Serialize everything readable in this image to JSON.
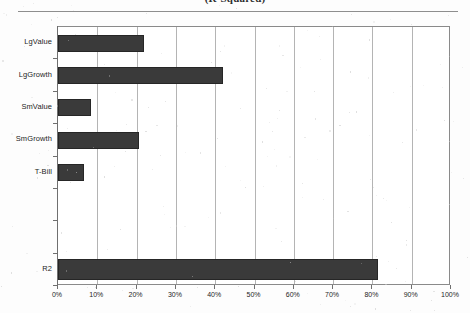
{
  "title": {
    "text": "(R-Squared)",
    "visible_note": "cropped at top edge"
  },
  "chart_data": {
    "type": "bar",
    "orientation": "horizontal",
    "title": "(R-Squared)",
    "xlabel": "",
    "ylabel": "",
    "categories": [
      "LgValue",
      "LgGrowth",
      "SmValue",
      "SmGrowth",
      "T-Bill",
      "",
      "",
      "R2"
    ],
    "values": [
      22,
      42,
      8.5,
      20.5,
      6.5,
      null,
      null,
      81.5
    ],
    "xlim": [
      0,
      100
    ],
    "xticks": [
      0,
      10,
      20,
      30,
      40,
      50,
      60,
      70,
      80,
      90,
      100
    ],
    "xticklabels": [
      "0%",
      "10%",
      "20%",
      "30%",
      "40%",
      "50%",
      "60%",
      "70%",
      "80%",
      "90%",
      "100%"
    ],
    "grid": true,
    "grid_axis": "x",
    "legend": false,
    "bar_color": "#3a3a3a"
  },
  "axis": {
    "x": {
      "ticks": [
        {
          "value": 0,
          "label": "0%"
        },
        {
          "value": 10,
          "label": "10%"
        },
        {
          "value": 20,
          "label": "20%"
        },
        {
          "value": 30,
          "label": "30%"
        },
        {
          "value": 40,
          "label": "40%"
        },
        {
          "value": 50,
          "label": "50%"
        },
        {
          "value": 60,
          "label": "60%"
        },
        {
          "value": 70,
          "label": "70%"
        },
        {
          "value": 80,
          "label": "80%"
        },
        {
          "value": 90,
          "label": "90%"
        },
        {
          "value": 100,
          "label": "100%"
        }
      ]
    },
    "y": {
      "categories": [
        {
          "label": "LgValue",
          "value": 22
        },
        {
          "label": "LgGrowth",
          "value": 42
        },
        {
          "label": "SmValue",
          "value": 8.5
        },
        {
          "label": "SmGrowth",
          "value": 20.5
        },
        {
          "label": "T-Bill",
          "value": 6.5
        },
        {
          "label": "",
          "value": null
        },
        {
          "label": "",
          "value": null
        },
        {
          "label": "R2",
          "value": 81.5
        }
      ]
    }
  },
  "colors": {
    "bar": "#3a3a3a",
    "bar_edge": "#262626",
    "grid": "#b4b4b4",
    "frame": "#8a8a8a",
    "text": "#1d1d1d",
    "page": "#fdfdfd"
  }
}
